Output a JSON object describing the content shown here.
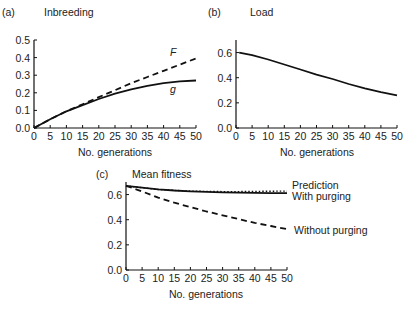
{
  "chart_data": [
    {
      "id": "a",
      "type": "line",
      "panel_label": "(a)",
      "title": "Inbreeding",
      "xlabel": "No. generations",
      "ylabel": "",
      "xlim": [
        0,
        50
      ],
      "ylim": [
        0,
        0.5
      ],
      "xticks": [
        0,
        5,
        10,
        15,
        20,
        25,
        30,
        35,
        40,
        45,
        50
      ],
      "yticks": [
        0.0,
        0.1,
        0.2,
        0.3,
        0.4,
        0.5
      ],
      "ytick_labels": [
        "0.0",
        "0.1",
        "0.2",
        "0.3",
        "0.4",
        "0.5"
      ],
      "grid": false,
      "x": [
        0,
        5,
        10,
        15,
        20,
        25,
        30,
        35,
        40,
        45,
        50
      ],
      "series": [
        {
          "name": "F",
          "style": "dashed",
          "values": [
            0.0,
            0.05,
            0.095,
            0.135,
            0.175,
            0.215,
            0.255,
            0.29,
            0.325,
            0.36,
            0.395
          ]
        },
        {
          "name": "g",
          "style": "solid",
          "values": [
            0.0,
            0.05,
            0.095,
            0.13,
            0.165,
            0.195,
            0.22,
            0.24,
            0.255,
            0.265,
            0.27
          ]
        }
      ],
      "annotations": [
        {
          "text": "F",
          "x": 42,
          "y": 0.41
        },
        {
          "text": "g",
          "x": 42,
          "y": 0.2
        }
      ]
    },
    {
      "id": "b",
      "type": "line",
      "panel_label": "(b)",
      "title": "Load",
      "xlabel": "No. generations",
      "ylabel": "",
      "xlim": [
        0,
        50
      ],
      "ylim": [
        0,
        0.7
      ],
      "xticks": [
        0,
        5,
        10,
        15,
        20,
        25,
        30,
        35,
        40,
        45,
        50
      ],
      "yticks": [
        0.0,
        0.2,
        0.4,
        0.6
      ],
      "ytick_labels": [
        "0.0",
        "0.2",
        "0.4",
        "0.6"
      ],
      "grid": false,
      "x": [
        1,
        5,
        10,
        15,
        20,
        25,
        30,
        35,
        40,
        45,
        50
      ],
      "series": [
        {
          "name": "Load",
          "style": "solid",
          "values": [
            0.6,
            0.58,
            0.545,
            0.505,
            0.465,
            0.425,
            0.39,
            0.35,
            0.315,
            0.285,
            0.26
          ]
        }
      ]
    },
    {
      "id": "c",
      "type": "line",
      "panel_label": "(c)",
      "title": "Mean fitness",
      "xlabel": "No. generations",
      "ylabel": "",
      "xlim": [
        0,
        50
      ],
      "ylim": [
        0,
        0.7
      ],
      "xticks": [
        0,
        5,
        10,
        15,
        20,
        25,
        30,
        35,
        40,
        45,
        50
      ],
      "yticks": [
        0.0,
        0.2,
        0.4,
        0.6
      ],
      "ytick_labels": [
        "0.0",
        "0.2",
        "0.4",
        "0.6"
      ],
      "grid": false,
      "x": [
        0,
        5,
        10,
        15,
        20,
        25,
        30,
        35,
        40,
        45,
        50
      ],
      "series": [
        {
          "name": "Prediction",
          "style": "dotted",
          "values": [
            0.67,
            0.655,
            0.64,
            0.633,
            0.628,
            0.625,
            0.624,
            0.624,
            0.625,
            0.627,
            0.628
          ]
        },
        {
          "name": "With purging",
          "style": "solid",
          "values": [
            0.67,
            0.655,
            0.642,
            0.632,
            0.626,
            0.622,
            0.618,
            0.616,
            0.614,
            0.612,
            0.611
          ]
        },
        {
          "name": "Without purging",
          "style": "dashed",
          "values": [
            0.67,
            0.625,
            0.575,
            0.535,
            0.5,
            0.465,
            0.435,
            0.405,
            0.375,
            0.35,
            0.325
          ]
        }
      ],
      "legend_position": "right, inline labels"
    }
  ]
}
